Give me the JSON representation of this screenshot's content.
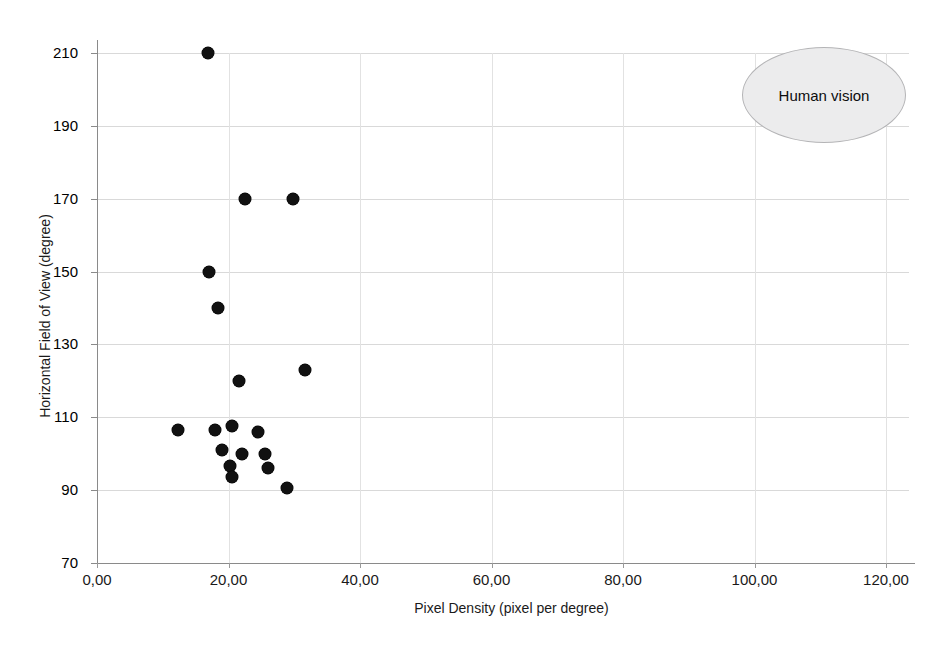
{
  "chart_data": {
    "type": "scatter",
    "title": "",
    "xlabel": "Pixel Density (pixel per degree)",
    "ylabel": "Horizontal Field of View (degree)",
    "xlim": [
      0,
      124
    ],
    "ylim": [
      70,
      212
    ],
    "xticks": [
      0,
      20,
      40,
      60,
      80,
      100,
      120
    ],
    "xtick_labels": [
      "0,00",
      "20,00",
      "40,00",
      "60,00",
      "80,00",
      "100,00",
      "120,00"
    ],
    "yticks": [
      70,
      90,
      110,
      130,
      150,
      170,
      190,
      210
    ],
    "ytick_labels": [
      "70",
      "90",
      "110",
      "130",
      "150",
      "170",
      "190",
      "210"
    ],
    "grid": true,
    "legend": null,
    "marker_color": "#111111",
    "marker_shape": "circle",
    "points": [
      {
        "x": 16.9,
        "y": 210
      },
      {
        "x": 22.5,
        "y": 170
      },
      {
        "x": 29.8,
        "y": 170
      },
      {
        "x": 17.0,
        "y": 150
      },
      {
        "x": 18.4,
        "y": 140
      },
      {
        "x": 21.6,
        "y": 120
      },
      {
        "x": 31.6,
        "y": 123
      },
      {
        "x": 12.3,
        "y": 106.5
      },
      {
        "x": 17.9,
        "y": 106.5
      },
      {
        "x": 20.5,
        "y": 107.5
      },
      {
        "x": 24.5,
        "y": 106
      },
      {
        "x": 19.0,
        "y": 101
      },
      {
        "x": 22.0,
        "y": 100
      },
      {
        "x": 25.5,
        "y": 100
      },
      {
        "x": 20.3,
        "y": 96.5
      },
      {
        "x": 20.5,
        "y": 93.5
      },
      {
        "x": 26.0,
        "y": 96
      },
      {
        "x": 28.9,
        "y": 90.5
      }
    ],
    "annotations": [
      {
        "label": "Human vision",
        "shape": "ellipse",
        "fill_color": "#ececed",
        "stroke_color": "#b4b4b6",
        "center_x": 110.5,
        "center_y": 192,
        "width_units": 24.9,
        "height_units": 37.6
      }
    ]
  }
}
